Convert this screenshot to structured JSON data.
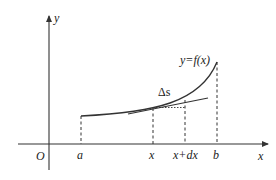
{
  "diagram": {
    "title": "",
    "colors": {
      "stroke": "#333333",
      "text": "#222222",
      "background": "#ffffff"
    },
    "axes": {
      "x_label": "x",
      "y_label": "y",
      "origin_label": "O"
    },
    "curve_label": "y=f(x)",
    "arc_label": "Δs",
    "ticks": [
      {
        "id": "a",
        "label": "a"
      },
      {
        "id": "x",
        "label": "x"
      },
      {
        "id": "x_dx",
        "label": "x+dx"
      },
      {
        "id": "b",
        "label": "b"
      }
    ]
  }
}
